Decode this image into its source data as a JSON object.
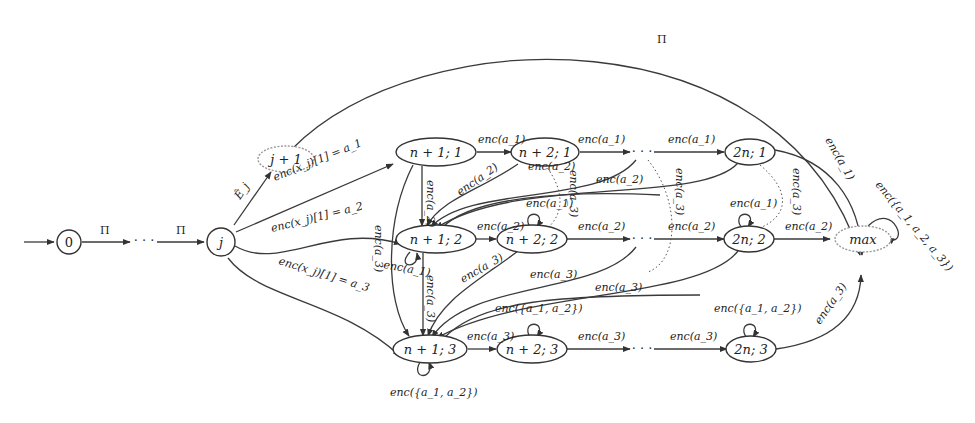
{
  "diagram": {
    "type": "state-automaton",
    "nodes": {
      "s0": {
        "label": "0"
      },
      "j": {
        "label": "j"
      },
      "j1": {
        "label": "j + 1"
      },
      "n11": {
        "label": "n + 1; 1"
      },
      "n21": {
        "label": "n + 2; 1"
      },
      "n2n1": {
        "label": "2n; 1"
      },
      "n12": {
        "label": "n + 1; 2"
      },
      "n22": {
        "label": "n + 2; 2"
      },
      "n2n2": {
        "label": "2n; 2"
      },
      "n13": {
        "label": "n + 1; 3"
      },
      "n23": {
        "label": "n + 2; 3"
      },
      "n2n3": {
        "label": "2n; 3"
      },
      "max": {
        "label": "max"
      }
    },
    "ellipsis": "· · ·",
    "edges": {
      "pi": "Π",
      "ej": "Ê_j",
      "x_a1": "enc(x_j)[1] = a_1",
      "x_a2": "enc(x_j)[1] = a_2",
      "x_a3": "enc(x_j)[1] = a_3",
      "enc_a1": "enc(a_1)",
      "enc_a2": "enc(a_2)",
      "enc_a3": "enc(a_3)",
      "enc_a12": "enc({a_1, a_2})",
      "enc_a123": "enc({a_1, a_2, a_3})"
    }
  }
}
